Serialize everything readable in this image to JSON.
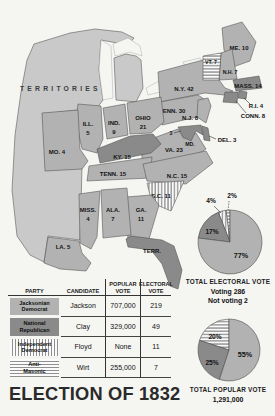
{
  "page": {
    "title": "ELECTION OF 1832"
  },
  "colors": {
    "jackson": "#b2b2b2",
    "clay": "#8a8a8a",
    "territory": "#c9c9c9",
    "stripe": "#8f8f8f",
    "background": "#f5f5f2"
  },
  "map": {
    "territories_label": "TERRITORIES",
    "states": [
      {
        "name": "Maine",
        "label": "ME. 10",
        "fill": "jackson"
      },
      {
        "name": "Vermont",
        "label": "VT. 7",
        "fill": "wirt"
      },
      {
        "name": "New Hampshire",
        "label": "N.H. 7",
        "fill": "jackson"
      },
      {
        "name": "Massachusetts",
        "label": "MASS. 14",
        "fill": "clay"
      },
      {
        "name": "Rhode Island",
        "label": "R.I. 4",
        "fill": "clay"
      },
      {
        "name": "Connecticut",
        "label": "CONN. 8",
        "fill": "clay"
      },
      {
        "name": "New York",
        "label": "N.Y. 42",
        "fill": "jackson"
      },
      {
        "name": "New Jersey",
        "label": "N.J. 8",
        "fill": "jackson"
      },
      {
        "name": "Pennsylvania",
        "label": "PENN. 30",
        "fill": "jackson"
      },
      {
        "name": "Delaware",
        "label": "DEL. 3",
        "fill": "clay"
      },
      {
        "name": "Maryland",
        "label": "MD.",
        "callout": "3",
        "fill": "clay"
      },
      {
        "name": "Virginia",
        "label": "VA. 23",
        "fill": "jackson"
      },
      {
        "name": "North Carolina",
        "label": "N.C. 15",
        "fill": "jackson"
      },
      {
        "name": "South Carolina",
        "label": "S.C. 11",
        "fill": "floyd"
      },
      {
        "name": "Georgia",
        "label": "GA.",
        "label2": "11",
        "fill": "jackson"
      },
      {
        "name": "Ohio",
        "label": "OHIO",
        "label2": "21",
        "fill": "jackson"
      },
      {
        "name": "Indiana",
        "label": "IND.",
        "label2": "9",
        "fill": "jackson"
      },
      {
        "name": "Illinois",
        "label": "ILL.",
        "label2": "5",
        "fill": "jackson"
      },
      {
        "name": "Kentucky",
        "label": "KY. 15",
        "fill": "clay"
      },
      {
        "name": "Tennessee",
        "label": "TENN. 15",
        "fill": "jackson"
      },
      {
        "name": "Missouri",
        "label": "MO. 4",
        "fill": "jackson"
      },
      {
        "name": "Mississippi",
        "label": "MISS.",
        "label2": "4",
        "fill": "jackson"
      },
      {
        "name": "Alabama",
        "label": "ALA.",
        "label2": "7",
        "fill": "jackson"
      },
      {
        "name": "Louisiana",
        "label": "LA. 5",
        "fill": "jackson"
      },
      {
        "name": "Florida Territory",
        "label": "TERR.",
        "fill": "clay"
      }
    ]
  },
  "table": {
    "headers": {
      "party": "PARTY",
      "candidate": "CANDIDATE",
      "popular1": "POPULAR",
      "popular2": "VOTE",
      "electoral1": "ELECTORAL",
      "electoral2": "VOTE"
    },
    "rows": [
      {
        "party1": "Jacksonian",
        "party2": "Democrat",
        "candidate": "Jackson",
        "popular": "707,000",
        "electoral": "219",
        "swatch": "jackson"
      },
      {
        "party1": "National",
        "party2": "Republican",
        "candidate": "Clay",
        "popular": "329,000",
        "electoral": "49",
        "swatch": "clay"
      },
      {
        "party1": "Independent",
        "party2": "Democrat",
        "candidate": "Floyd",
        "popular": "None",
        "electoral": "11",
        "swatch": "floyd"
      },
      {
        "party1": "Anti-",
        "party2": "Masonic",
        "candidate": "Wirt",
        "popular": "255,000",
        "electoral": "7",
        "swatch": "wirt"
      }
    ]
  },
  "chart_data": [
    {
      "type": "pie",
      "title": "TOTAL ELECTORAL VOTE",
      "notes": [
        "Voting 286",
        "Not voting 2"
      ],
      "legend_position": "none",
      "slices": [
        {
          "name": "Jackson",
          "pct": 77,
          "label": "77%",
          "fill": "jackson"
        },
        {
          "name": "Clay",
          "pct": 17,
          "label": "17%",
          "fill": "clay"
        },
        {
          "name": "Floyd",
          "pct": 4,
          "label": "4%",
          "fill": "floyd"
        },
        {
          "name": "Wirt",
          "pct": 2,
          "label": "2%",
          "fill": "wirt"
        }
      ]
    },
    {
      "type": "pie",
      "title": "TOTAL POPULAR VOTE",
      "notes": [
        "1,291,000"
      ],
      "legend_position": "none",
      "slices": [
        {
          "name": "Jackson",
          "pct": 55,
          "label": "55%",
          "fill": "jackson"
        },
        {
          "name": "Clay",
          "pct": 25,
          "label": "25%",
          "fill": "clay"
        },
        {
          "name": "Wirt",
          "pct": 20,
          "label": "20%",
          "fill": "wirt"
        }
      ]
    }
  ]
}
